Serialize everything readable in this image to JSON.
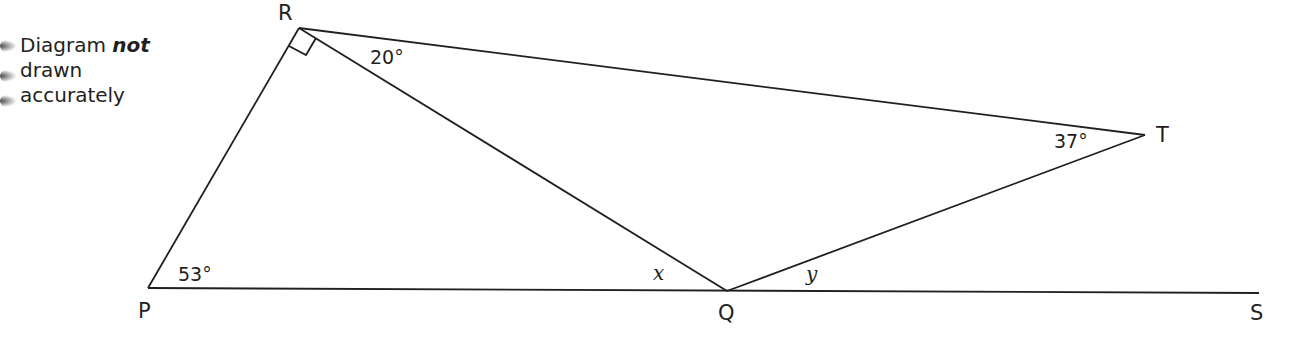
{
  "note": {
    "line1_prefix": "Diagram ",
    "line1_emphasis": "not",
    "line2": "drawn",
    "line3": "accurately"
  },
  "points": {
    "P": {
      "label": "P",
      "x": 148,
      "y": 288
    },
    "Q": {
      "label": "Q",
      "x": 727,
      "y": 291
    },
    "R": {
      "label": "R",
      "x": 299,
      "y": 28
    },
    "S": {
      "label": "S",
      "x": 1259,
      "y": 293
    },
    "T": {
      "label": "T",
      "x": 1145,
      "y": 135
    }
  },
  "angles": {
    "P": "53°",
    "R_QRT": "20°",
    "T": "37°",
    "x": "x",
    "y": "y",
    "R_right_angle": "90°"
  },
  "colors": {
    "line": "#231f20",
    "background": "#ffffff"
  }
}
